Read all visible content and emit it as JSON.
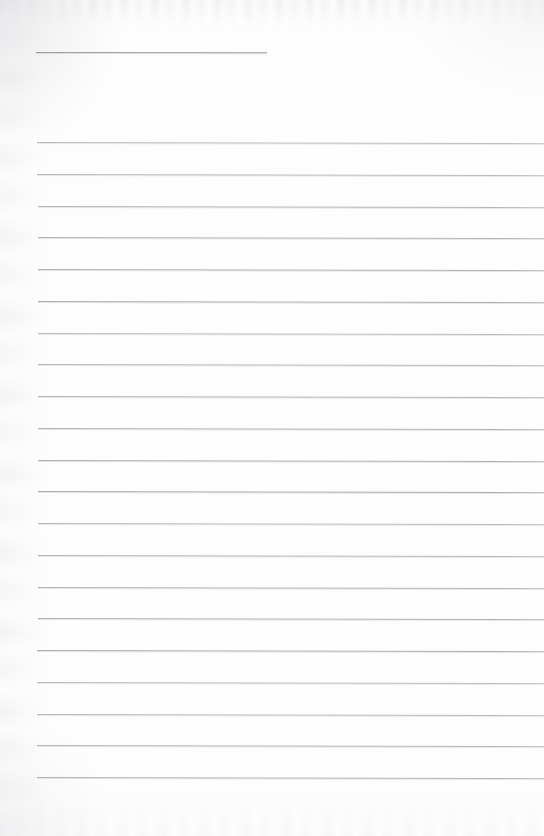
{
  "document": {
    "kind": "lined-notebook-page",
    "title_text": "",
    "body_text": "",
    "page_width": 544,
    "page_height": 836,
    "background_color": "#fdfdfd",
    "rule_color": "#a9abb0",
    "title_rule_color": "#9b9da3",
    "rule_count": 21,
    "rule_spacing_px": 31.75,
    "first_rule_y": 142,
    "last_rule_y": 777,
    "rule_left_margin_px": 37,
    "rule_right_edge_px": 544,
    "title_rule": {
      "name": "title-underline",
      "y": 52,
      "x_start": 36,
      "x_end": 267,
      "width_px": 231
    },
    "rule_tilt_deg": 0.12,
    "bottom_blank_margin_px": 59,
    "rules": [
      {
        "y": 142,
        "x_start": 37
      },
      {
        "y": 173.8,
        "x_start": 37
      },
      {
        "y": 205.5,
        "x_start": 38
      },
      {
        "y": 237.3,
        "x_start": 38
      },
      {
        "y": 269.0,
        "x_start": 38
      },
      {
        "y": 300.8,
        "x_start": 38
      },
      {
        "y": 332.5,
        "x_start": 38
      },
      {
        "y": 364.3,
        "x_start": 38
      },
      {
        "y": 396.0,
        "x_start": 38
      },
      {
        "y": 427.8,
        "x_start": 38
      },
      {
        "y": 459.5,
        "x_start": 38
      },
      {
        "y": 491.3,
        "x_start": 38
      },
      {
        "y": 523.0,
        "x_start": 38
      },
      {
        "y": 554.8,
        "x_start": 38
      },
      {
        "y": 586.5,
        "x_start": 38
      },
      {
        "y": 618.3,
        "x_start": 38
      },
      {
        "y": 650.0,
        "x_start": 37
      },
      {
        "y": 681.8,
        "x_start": 37
      },
      {
        "y": 713.5,
        "x_start": 37
      },
      {
        "y": 745.3,
        "x_start": 37
      },
      {
        "y": 777.0,
        "x_start": 37
      }
    ]
  }
}
